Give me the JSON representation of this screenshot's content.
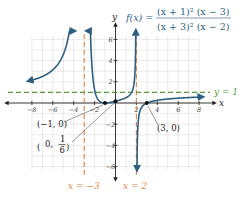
{
  "chart_data": {
    "type": "line",
    "function": {
      "label_lhs": "f(x) =",
      "numerator": "(x + 1)² (x − 3)",
      "denominator": "(x + 3)² (x − 2)"
    },
    "xlabel": "x",
    "ylabel": "y",
    "xlim": [
      -8,
      8
    ],
    "ylim": [
      -6,
      6
    ],
    "grid": true,
    "x_ticks": [
      -8,
      -6,
      -4,
      -2,
      2,
      4,
      6,
      8
    ],
    "x_tick_labels": [
      "−8",
      "−6",
      "−4",
      "−2",
      "2",
      "4",
      "6",
      "8"
    ],
    "y_ticks": [
      -6,
      -4,
      -2,
      2,
      4,
      6
    ],
    "y_tick_labels": [
      "−6",
      "−4",
      "−2",
      "2",
      "4",
      "6"
    ],
    "vertical_asymptotes": [
      {
        "x": -3,
        "label": "x = −3",
        "color": "#e0874a"
      },
      {
        "x": 2,
        "label": "x = 2",
        "color": "#e0874a"
      }
    ],
    "horizontal_asymptotes": [
      {
        "y": 1,
        "label": "y = 1",
        "color": "#5a9a3c"
      }
    ],
    "points": [
      {
        "x": -1,
        "y": 0,
        "label": "(−1, 0)"
      },
      {
        "x": 0,
        "y": 0.1667,
        "label": "(0, 1/6)"
      },
      {
        "x": 3,
        "y": 0,
        "label": "(3, 0)"
      }
    ],
    "series": [
      {
        "name": "f(x)",
        "color": "#2e5f80",
        "branches": [
          {
            "x_range": [
              -8.3,
              -3.9
            ],
            "arrow_ends": "both"
          },
          {
            "x_range": [
              -2.75,
              1.94
            ],
            "arrow_ends": "both"
          },
          {
            "x_range": [
              2.05,
              8.3
            ],
            "arrow_ends": "both"
          }
        ]
      }
    ]
  },
  "labels": {
    "y_axis": "y",
    "x_axis": "x",
    "fx": "f(x) =",
    "num": "(x + 1)² (x − 3)",
    "den": "(x + 3)² (x − 2)",
    "va_left": "x = −3",
    "va_right": "x = 2",
    "ha": "y = 1",
    "pt1": "(−1, 0)",
    "pt2_prefix": "0,",
    "pt2_num": "1",
    "pt2_den": "6",
    "pt3": "(3, 0)"
  }
}
